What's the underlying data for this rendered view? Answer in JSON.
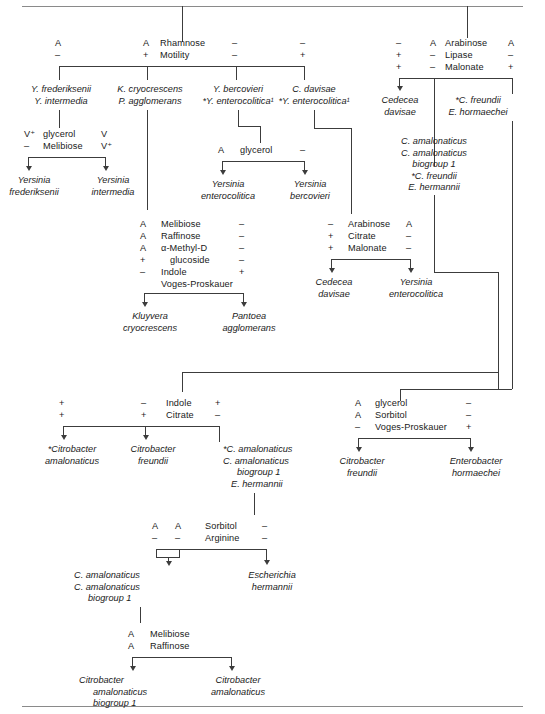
{
  "figure": {
    "type": "dichotomous-identification-key"
  },
  "rules": {
    "top_y": 6,
    "bottom_y": 706
  },
  "tests": {
    "rhamnose_motility": {
      "names": [
        "Rhamnose",
        "Motility"
      ],
      "columns": [
        {
          "values": [
            "A",
            "–"
          ]
        },
        {
          "values": [
            "A",
            "+"
          ]
        },
        {
          "values": [
            "–",
            "–"
          ]
        },
        {
          "values": [
            "–",
            "+"
          ]
        }
      ]
    },
    "arabinose_lipase_malonate": {
      "names": [
        "Arabinose",
        "Lipase",
        "Malonate"
      ],
      "columns": [
        {
          "values": [
            "–",
            "+",
            "+"
          ]
        },
        {
          "values": [
            "A",
            "–",
            "–"
          ]
        },
        {
          "values": [
            "A",
            "–",
            "+"
          ]
        }
      ]
    },
    "glycerol_melibiose": {
      "names": [
        "glycerol",
        "Melibiose"
      ],
      "columns": [
        {
          "values": [
            "V⁺",
            "–"
          ]
        },
        {
          "values": [
            "V",
            "V⁺"
          ]
        }
      ]
    },
    "glycerol_yersinia": {
      "names": [
        "glycerol"
      ],
      "columns": [
        {
          "values": [
            "A"
          ]
        },
        {
          "values": [
            "–"
          ]
        }
      ]
    },
    "kluyvera_pantoea": {
      "names": [
        "Melibiose",
        "Raffinose",
        "α-Methyl-D",
        "glucoside",
        "Indole",
        "Voges-Proskauer"
      ],
      "left": [
        "A",
        "A",
        "A",
        "+",
        "–"
      ],
      "right": [
        "–",
        "–",
        "–",
        "–",
        "+"
      ]
    },
    "arabinose_citrate_malonate": {
      "names": [
        "Arabinose",
        "Citrate",
        "Malonate"
      ],
      "left": [
        "–",
        "+",
        "+"
      ],
      "right": [
        "A",
        "–",
        "–"
      ]
    },
    "indole_citrate": {
      "names": [
        "Indole",
        "Citrate"
      ],
      "columns": [
        {
          "values": [
            "+",
            "+"
          ]
        },
        {
          "values": [
            "–",
            "+"
          ]
        },
        {
          "values": [
            "+",
            "–"
          ]
        }
      ]
    },
    "glycerol_sorbitol_vp": {
      "names": [
        "glycerol",
        "Sorbitol",
        "Voges-Proskauer"
      ],
      "left": [
        "A",
        "A",
        "–"
      ],
      "right": [
        "–",
        "–",
        "+"
      ]
    },
    "sorbitol_arginine": {
      "names": [
        "Sorbitol",
        "Arginine"
      ],
      "columns": [
        {
          "values": [
            "A",
            "–"
          ]
        },
        {
          "values": [
            "A",
            "–"
          ]
        },
        {
          "values": [
            "–",
            "–"
          ]
        }
      ]
    },
    "melibiose_raffinose": {
      "names": [
        "Melibiose",
        "Raffinose"
      ],
      "left": [
        "A",
        "A"
      ]
    }
  },
  "groups": {
    "yersinia_pair": {
      "lines": [
        "Y. frederiksenii",
        "Y. intermedia"
      ]
    },
    "kluyvera_pantoea_pair": {
      "lines": [
        "K. cryocrescens",
        "P. agglomerans"
      ]
    },
    "bercovieri_pair": {
      "lines": [
        "Y. bercovieri",
        "*Y. enterocolitica¹"
      ]
    },
    "davisae_pair": {
      "lines": [
        "C. davisae",
        "*Y. enterocolitica¹"
      ]
    },
    "cedecea_davisae": {
      "lines": [
        "Cedecea",
        "davisae"
      ]
    },
    "freundii_hormaechei": {
      "lines": [
        "*C. freundii",
        "E. hormaechei"
      ]
    },
    "amalonaticus_group": {
      "lines": [
        "C. amalonaticus",
        "C. amalonaticus",
        "biogroup 1",
        "*C. freundii",
        "E. hermannii"
      ]
    },
    "amalonaticus_group2": {
      "lines": [
        "*C. amalonaticus",
        "C. amalonaticus",
        "biogroup 1",
        "E. hermannii"
      ]
    },
    "amalonaticus_pair": {
      "lines": [
        "C. amalonaticus",
        "C. amalonaticus",
        "biogroup 1"
      ]
    }
  },
  "endpoints": {
    "yersinia_frederiksenii": {
      "lines": [
        "Yersinia",
        "frederiksenii"
      ]
    },
    "yersinia_intermedia": {
      "lines": [
        "Yersinia",
        "intermedia"
      ]
    },
    "yersinia_enterocolitica": {
      "lines": [
        "Yersinia",
        "enterocolitica"
      ]
    },
    "yersinia_bercovieri": {
      "lines": [
        "Yersinia",
        "bercovieri"
      ]
    },
    "kluyvera_cryocrescens": {
      "lines": [
        "Kluyvera",
        "cryocrescens"
      ]
    },
    "pantoea_agglomerans": {
      "lines": [
        "Pantoea",
        "agglomerans"
      ]
    },
    "cedecea_davisae_end": {
      "lines": [
        "Cedecea",
        "davisae"
      ]
    },
    "yersinia_enterocolitica_end": {
      "lines": [
        "Yersinia",
        "enterocolitica"
      ]
    },
    "citrobacter_amalonaticus_star": {
      "lines": [
        "*Citrobacter",
        "amalonaticus"
      ]
    },
    "citrobacter_freundii_mid": {
      "lines": [
        "Citrobacter",
        "freundii"
      ]
    },
    "citrobacter_freundii_right": {
      "lines": [
        "Citrobacter",
        "freundii"
      ]
    },
    "enterobacter_hormaechei": {
      "lines": [
        "Enterobacter",
        "hormaechei"
      ]
    },
    "escherichia_hermannii": {
      "lines": [
        "Escherichia",
        "hermannii"
      ]
    },
    "citrobacter_amalonaticus_bio1": {
      "lines": [
        "Citrobacter",
        "amalonaticus",
        "biogroup 1"
      ]
    },
    "citrobacter_amalonaticus": {
      "lines": [
        "Citrobacter",
        "amalonaticus"
      ]
    }
  }
}
